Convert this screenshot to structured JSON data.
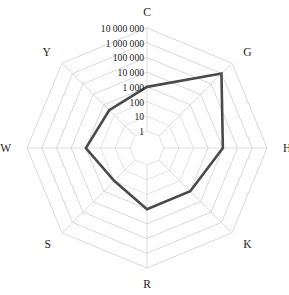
{
  "chart_data": {
    "type": "radar",
    "title": "",
    "subtitle": "",
    "xlabel": "",
    "ylabel": "",
    "scale": "log10",
    "grid": true,
    "legend": "none",
    "categories": [
      "C",
      "G",
      "H",
      "K",
      "R",
      "S",
      "W",
      "Y"
    ],
    "tick_labels": [
      "1",
      "10",
      "100",
      "1 000",
      "10 000",
      "100 000",
      "1 000 000",
      "10 000 000"
    ],
    "tick_values": [
      1,
      10,
      100,
      1000,
      10000,
      100000,
      1000000,
      10000000
    ],
    "rlim": [
      1,
      10000000
    ],
    "series": [
      {
        "name": "series-1",
        "color": "#4a4a4a",
        "values": [
          1000,
          1000000,
          10000,
          1000,
          1000,
          100,
          1000,
          300
        ]
      }
    ],
    "axis_label_positions": {
      "C": "top",
      "G": "upper-right",
      "H": "right",
      "K": "lower-right",
      "R": "bottom",
      "S": "lower-left",
      "W": "left",
      "Y": "upper-left"
    }
  },
  "colors": {
    "series": "#4a4a4a",
    "grid": "#c9c9c9",
    "text": "#1a1a1a",
    "background": "#ffffff"
  }
}
